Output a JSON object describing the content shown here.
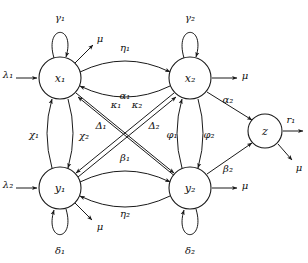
{
  "diagram": {
    "type": "state-transition-graph",
    "title": "",
    "background_color": "#ffffff",
    "stroke_color": "#1a1a1a",
    "nodes": [
      {
        "id": "x1",
        "label": "x₁",
        "cx": 60,
        "cy": 78,
        "r": 21
      },
      {
        "id": "x2",
        "label": "x₂",
        "cx": 190,
        "cy": 78,
        "r": 21
      },
      {
        "id": "y1",
        "label": "y₁",
        "cx": 60,
        "cy": 188,
        "r": 21
      },
      {
        "id": "y2",
        "label": "y₂",
        "cx": 190,
        "cy": 188,
        "r": 21
      },
      {
        "id": "z",
        "label": "z",
        "cx": 265,
        "cy": 131,
        "r": 17
      }
    ],
    "self_loops": [
      {
        "node": "x1",
        "label": "γ₁",
        "direction": "up"
      },
      {
        "node": "x2",
        "label": "γ₂",
        "direction": "up"
      },
      {
        "node": "y1",
        "label": "δ₁",
        "direction": "down"
      },
      {
        "node": "y2",
        "label": "δ₂",
        "direction": "down"
      }
    ],
    "inflow_arrows": [
      {
        "target": "x1",
        "label": "λ₁",
        "direction": "from-left"
      },
      {
        "target": "y1",
        "label": "λ₂",
        "direction": "from-left"
      }
    ],
    "outflow_arrows": [
      {
        "source": "x1",
        "label": "μ",
        "direction": "up-right"
      },
      {
        "source": "x2",
        "label": "μ",
        "direction": "right"
      },
      {
        "source": "y1",
        "label": "μ",
        "direction": "down-right"
      },
      {
        "source": "y2",
        "label": "μ",
        "direction": "right"
      },
      {
        "source": "z",
        "label": "μ",
        "direction": "down-right"
      },
      {
        "source": "z",
        "label": "r₁",
        "direction": "right"
      }
    ],
    "edges": [
      {
        "from": "x1",
        "to": "x2",
        "label": "η₁",
        "style": "curve-top",
        "label_position": "above"
      },
      {
        "from": "x2",
        "to": "x1",
        "label": "α₁",
        "style": "curve-bottom",
        "label_position": "below"
      },
      {
        "from": "y1",
        "to": "y2",
        "label": "β₁",
        "style": "curve-top",
        "label_position": "above"
      },
      {
        "from": "y2",
        "to": "y1",
        "label": "η₂",
        "style": "curve-bottom",
        "label_position": "below"
      },
      {
        "from": "y1",
        "to": "x1",
        "label": "χ₁",
        "style": "vertical-left",
        "label_position": "left"
      },
      {
        "from": "x1",
        "to": "y1",
        "label": "χ₂",
        "style": "vertical-right",
        "label_position": "right"
      },
      {
        "from": "y2",
        "to": "x2",
        "label": "φ₁",
        "style": "vertical-left",
        "label_position": "left"
      },
      {
        "from": "x2",
        "to": "y2",
        "label": "φ₂",
        "style": "vertical-right",
        "label_position": "right"
      },
      {
        "from": "y2",
        "to": "x1",
        "label": "κ₁",
        "style": "diagonal",
        "label_position": "upper-mid"
      },
      {
        "from": "y1",
        "to": "x2",
        "label": "κ₂",
        "style": "diagonal",
        "label_position": "upper-mid"
      },
      {
        "from": "x1",
        "to": "y2",
        "label": "Δ₁",
        "style": "diagonal",
        "label_position": "mid-left"
      },
      {
        "from": "x2",
        "to": "y1",
        "label": "Δ₂",
        "style": "diagonal",
        "label_position": "mid-right"
      },
      {
        "from": "x2",
        "to": "z",
        "label": "α₂",
        "style": "straight",
        "label_position": "above"
      },
      {
        "from": "y2",
        "to": "z",
        "label": "β₂",
        "style": "straight",
        "label_position": "above"
      }
    ],
    "parameter_symbols": [
      "γ₁",
      "γ₂",
      "δ₁",
      "δ₂",
      "λ₁",
      "λ₂",
      "μ",
      "r₁",
      "η₁",
      "η₂",
      "α₁",
      "α₂",
      "β₁",
      "β₂",
      "χ₁",
      "χ₂",
      "φ₁",
      "φ₂",
      "κ₁",
      "κ₂",
      "Δ₁",
      "Δ₂"
    ]
  }
}
